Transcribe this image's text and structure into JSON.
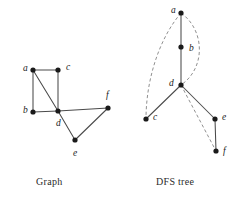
{
  "figure": {
    "background_color": "#ffffff",
    "solid_edge_color": "#4a4a4a",
    "dashed_edge_color": "#8a8a8a",
    "node_color": "#1a1a1a"
  },
  "graph_panel": {
    "caption": "Graph",
    "nodes": [
      {
        "id": "a",
        "label": "a",
        "x": 33,
        "y": 70,
        "label_x": 23,
        "label_y": 69
      },
      {
        "id": "b",
        "label": "b",
        "x": 33,
        "y": 112,
        "label_x": 23,
        "label_y": 111
      },
      {
        "id": "c",
        "label": "c",
        "x": 58,
        "y": 70,
        "label_x": 66,
        "label_y": 68
      },
      {
        "id": "d",
        "label": "d",
        "x": 58,
        "y": 111,
        "label_x": 56,
        "label_y": 124
      },
      {
        "id": "e",
        "label": "e",
        "x": 75,
        "y": 140,
        "label_x": 73,
        "label_y": 154
      },
      {
        "id": "f",
        "label": "f",
        "x": 108,
        "y": 108,
        "label_x": 106,
        "label_y": 96
      }
    ],
    "edges": [
      {
        "from": "a",
        "to": "c",
        "style": "solid"
      },
      {
        "from": "a",
        "to": "b",
        "style": "solid"
      },
      {
        "from": "a",
        "to": "d",
        "style": "solid"
      },
      {
        "from": "c",
        "to": "d",
        "style": "solid"
      },
      {
        "from": "b",
        "to": "d",
        "style": "solid"
      },
      {
        "from": "d",
        "to": "f",
        "style": "solid"
      },
      {
        "from": "d",
        "to": "e",
        "style": "solid"
      },
      {
        "from": "e",
        "to": "f",
        "style": "solid"
      }
    ]
  },
  "dfs_panel": {
    "caption": "DFS tree",
    "nodes": [
      {
        "id": "a",
        "label": "a",
        "x": 181,
        "y": 13,
        "label_x": 171,
        "label_y": 11
      },
      {
        "id": "b",
        "label": "b",
        "x": 181,
        "y": 47,
        "label_x": 189,
        "label_y": 49
      },
      {
        "id": "d",
        "label": "d",
        "x": 181,
        "y": 85,
        "label_x": 169,
        "label_y": 84
      },
      {
        "id": "c",
        "label": "c",
        "x": 146,
        "y": 119,
        "label_x": 153,
        "label_y": 118
      },
      {
        "id": "e",
        "label": "e",
        "x": 215,
        "y": 119,
        "label_x": 222,
        "label_y": 118
      },
      {
        "id": "f",
        "label": "f",
        "x": 216,
        "y": 151,
        "label_x": 223,
        "label_y": 152
      }
    ],
    "tree_edges": [
      {
        "from": "a",
        "to": "b",
        "style": "solid"
      },
      {
        "from": "b",
        "to": "d",
        "style": "solid"
      },
      {
        "from": "d",
        "to": "c",
        "style": "solid"
      },
      {
        "from": "d",
        "to": "e",
        "style": "solid"
      },
      {
        "from": "e",
        "to": "f",
        "style": "solid"
      }
    ],
    "back_edges": [
      {
        "from": "a",
        "to": "c",
        "style": "dashed",
        "shape": "curve-left"
      },
      {
        "from": "a",
        "to": "d",
        "style": "dashed",
        "shape": "curve-right"
      },
      {
        "from": "d",
        "to": "f",
        "style": "dashed",
        "shape": "straight"
      }
    ]
  }
}
